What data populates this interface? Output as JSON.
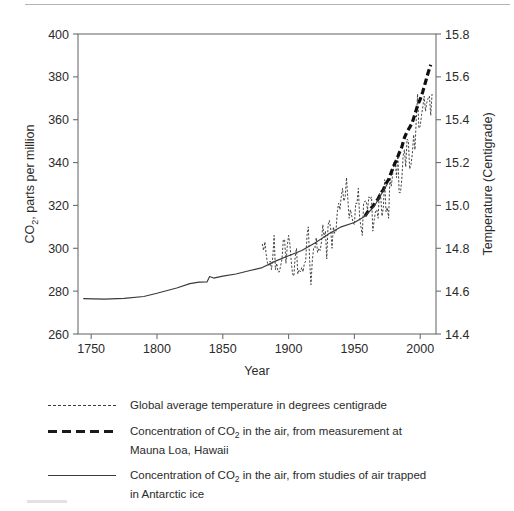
{
  "chart_data": {
    "type": "line",
    "title": "",
    "xlabel": "Year",
    "ylabel": "CO2, parts per million",
    "ylabel_left_main": "CO",
    "ylabel_left_sub": "2",
    "ylabel_left_rest": ", parts per million",
    "ylabel_right": "Temperature (Centigrade)",
    "xlim": [
      1740,
      2012
    ],
    "ylim_left": [
      260,
      400
    ],
    "ylim_right": [
      14.4,
      15.8
    ],
    "xticks": [
      1750,
      1800,
      1850,
      1900,
      1950,
      2000
    ],
    "yticks_left": [
      260,
      280,
      300,
      320,
      340,
      360,
      380,
      400
    ],
    "yticks_right": [
      "14.4",
      "14.6",
      "14.8",
      "15.0",
      "15.2",
      "15.4",
      "15.6",
      "15.8"
    ],
    "grid": false,
    "legend_position": "below",
    "series": [
      {
        "name": "Global average temperature in degrees centigrade",
        "style": "fine-dashed",
        "axis": "right",
        "color": "#3a3a3a",
        "x": [
          1880,
          1881,
          1882,
          1883,
          1884,
          1885,
          1886,
          1887,
          1888,
          1889,
          1890,
          1891,
          1892,
          1893,
          1894,
          1895,
          1896,
          1897,
          1898,
          1899,
          1900,
          1901,
          1902,
          1903,
          1904,
          1905,
          1906,
          1907,
          1908,
          1909,
          1910,
          1911,
          1912,
          1913,
          1914,
          1915,
          1916,
          1917,
          1918,
          1919,
          1920,
          1921,
          1922,
          1923,
          1924,
          1925,
          1926,
          1927,
          1928,
          1929,
          1930,
          1931,
          1932,
          1933,
          1934,
          1935,
          1936,
          1937,
          1938,
          1939,
          1940,
          1941,
          1942,
          1943,
          1944,
          1945,
          1946,
          1947,
          1948,
          1949,
          1950,
          1951,
          1952,
          1953,
          1954,
          1955,
          1956,
          1957,
          1958,
          1959,
          1960,
          1961,
          1962,
          1963,
          1964,
          1965,
          1966,
          1967,
          1968,
          1969,
          1970,
          1971,
          1972,
          1973,
          1974,
          1975,
          1976,
          1977,
          1978,
          1979,
          1980,
          1981,
          1982,
          1983,
          1984,
          1985,
          1986,
          1987,
          1988,
          1989,
          1990,
          1991,
          1992,
          1993,
          1994,
          1995,
          1996,
          1997,
          1998,
          1999,
          2000,
          2001,
          2002,
          2003,
          2004,
          2005,
          2006,
          2007,
          2008,
          2009
        ],
        "y": [
          14.82,
          14.79,
          14.83,
          14.77,
          14.73,
          14.72,
          14.74,
          14.7,
          14.76,
          14.86,
          14.7,
          14.73,
          14.69,
          14.69,
          14.72,
          14.75,
          14.84,
          14.84,
          14.73,
          14.81,
          14.86,
          14.82,
          14.74,
          14.68,
          14.67,
          14.76,
          14.8,
          14.68,
          14.7,
          14.69,
          14.71,
          14.69,
          14.73,
          14.74,
          14.86,
          14.9,
          14.74,
          14.63,
          14.74,
          14.8,
          14.8,
          14.85,
          14.78,
          14.8,
          14.79,
          14.83,
          14.91,
          14.85,
          14.88,
          14.75,
          14.91,
          14.93,
          14.89,
          14.8,
          14.9,
          14.87,
          14.88,
          14.97,
          15.01,
          14.98,
          15.04,
          15.08,
          15.02,
          15.04,
          15.13,
          15.03,
          14.94,
          14.98,
          14.95,
          14.92,
          14.91,
          15.01,
          15.01,
          15.08,
          14.94,
          14.9,
          14.86,
          15.01,
          15.02,
          15.02,
          14.98,
          15.04,
          15.03,
          15.04,
          14.88,
          14.93,
          14.97,
          14.98,
          14.94,
          15.06,
          15.04,
          14.95,
          14.99,
          15.12,
          14.97,
          14.99,
          14.94,
          15.13,
          15.09,
          15.14,
          15.2,
          15.21,
          15.13,
          15.24,
          15.06,
          15.06,
          15.12,
          15.23,
          15.26,
          15.18,
          15.31,
          15.3,
          15.17,
          15.19,
          15.24,
          15.33,
          15.26,
          15.4,
          15.52,
          15.36,
          15.37,
          15.42,
          15.46,
          15.51,
          15.44,
          15.48,
          15.5,
          15.51,
          15.42,
          15.52
        ]
      },
      {
        "name": "Concentration of CO2 in the air, from measurement at Mauna Loa, Hawaii",
        "style": "bold-dashed",
        "axis": "left",
        "color": "#101010",
        "x": [
          1958,
          1960,
          1962,
          1964,
          1966,
          1968,
          1970,
          1972,
          1974,
          1976,
          1978,
          1980,
          1982,
          1984,
          1986,
          1988,
          1990,
          1992,
          1994,
          1996,
          1998,
          2000,
          2002,
          2004,
          2006,
          2008
        ],
        "y": [
          315.0,
          316.9,
          318.4,
          319.6,
          321.4,
          323.0,
          325.7,
          327.4,
          330.2,
          332.1,
          335.4,
          338.7,
          341.1,
          344.4,
          347.2,
          351.6,
          354.4,
          356.4,
          358.8,
          362.6,
          366.7,
          369.5,
          373.2,
          377.5,
          381.9,
          385.6
        ]
      },
      {
        "name": "Concentration of CO2 in the air, from studies of air trapped in Antarctic ice",
        "style": "solid",
        "axis": "left",
        "color": "#3a3a3a",
        "x": [
          1744,
          1760,
          1775,
          1790,
          1800,
          1815,
          1825,
          1832,
          1838,
          1840,
          1843,
          1850,
          1860,
          1870,
          1880,
          1890,
          1900,
          1910,
          1920,
          1930,
          1940,
          1950,
          1958,
          1965,
          1975
        ],
        "y": [
          276.5,
          276.3,
          276.6,
          277.5,
          279.0,
          281.5,
          283.5,
          284.2,
          284.3,
          286.8,
          286.1,
          287.0,
          288.0,
          289.5,
          291.0,
          294.0,
          296.5,
          299.0,
          302.5,
          306.5,
          310.0,
          312.0,
          315.0,
          319.5,
          330.0
        ]
      }
    ]
  },
  "legend": {
    "items": [
      {
        "swatch": "fine-dashed",
        "lines": [
          "Global average temperature in degrees centigrade"
        ]
      },
      {
        "swatch": "bold-dashed",
        "lines": [
          "Concentration of CO",
          "2",
          " in the air, from measurement at",
          "Mauna Loa, Hawaii"
        ]
      },
      {
        "swatch": "solid",
        "lines": [
          "Concentration of CO",
          "2",
          " in the air, from studies of air trapped",
          "in Antarctic ice"
        ]
      }
    ]
  }
}
